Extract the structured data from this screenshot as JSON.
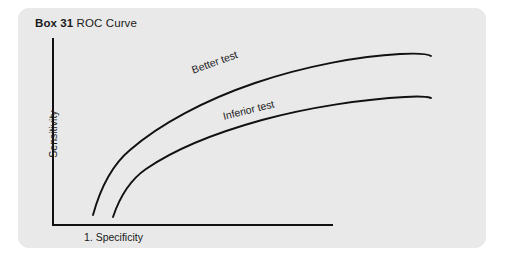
{
  "figure": {
    "panel_background": "#e9e9e9",
    "ink_color": "#111111",
    "title": {
      "box_number": "Box 31",
      "topic": " ROC Curve",
      "full": "Box 31 ROC Curve"
    },
    "axes": {
      "y_label": "Sensitivity",
      "x_label": "1. Specificity"
    },
    "curve_labels": {
      "better": "Better test",
      "inferior": "Inferior test"
    }
  },
  "chart_data": {
    "type": "line",
    "title": "Box 31 ROC Curve",
    "xlabel": "1. Specificity",
    "ylabel": "Sensitivity",
    "grid": false,
    "legend": "inline-annotations",
    "axis_ticks": [],
    "xlim": [
      0,
      1
    ],
    "ylim": [
      0,
      1
    ],
    "annotations": [
      "Better test",
      "Inferior test"
    ],
    "series": [
      {
        "name": "Better test",
        "x": [
          0.11,
          0.15,
          0.21,
          0.29,
          0.4,
          0.52,
          0.65,
          0.78,
          0.9,
          1.0
        ],
        "y": [
          0.07,
          0.26,
          0.43,
          0.57,
          0.69,
          0.78,
          0.85,
          0.9,
          0.925,
          0.92
        ],
        "path": "M 93,215 C 101,186 112,165 130,150 C 160,124 205,100 255,83 C 305,66 360,56 400,54 C 418,53 428,54 431,56"
      },
      {
        "name": "Inferior test",
        "x": [
          0.2,
          0.24,
          0.3,
          0.38,
          0.48,
          0.6,
          0.72,
          0.84,
          0.94,
          1.0
        ],
        "y": [
          0.05,
          0.2,
          0.34,
          0.46,
          0.56,
          0.64,
          0.7,
          0.735,
          0.75,
          0.75
        ],
        "path": "M 113,217 C 120,196 130,180 146,169 C 175,149 215,133 262,120 C 310,107 365,99 405,97 C 420,96 428,97 431,98"
      }
    ]
  }
}
